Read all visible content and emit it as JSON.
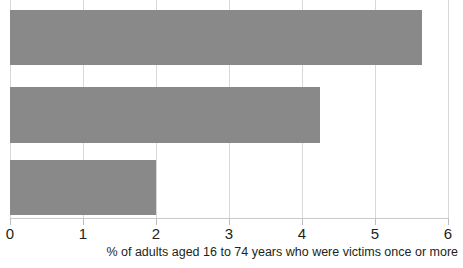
{
  "chart_data": {
    "type": "bar",
    "orientation": "horizontal",
    "title": "",
    "subtitle": "",
    "xlabel": "% of adults aged 16 to 74 years who were victims once or more",
    "ylabel": "",
    "xlim": [
      0,
      6
    ],
    "xticks": [
      0,
      1,
      2,
      3,
      4,
      5,
      6
    ],
    "xtick_labels": [
      "0",
      "1",
      "2",
      "3",
      "4",
      "5",
      "6"
    ],
    "grid": true,
    "grid_axis": "x",
    "legend": false,
    "legend_position": "none",
    "categories": [
      "",
      "",
      ""
    ],
    "values": [
      5.65,
      4.25,
      2.0
    ],
    "bar_color": "#898989",
    "gridline_color": "#d8d8d8",
    "axis_color": "#c9c9c9",
    "text_color": "#231f20",
    "bars": [
      {
        "index": 0,
        "label": "",
        "value": 5.65,
        "top": 10,
        "height": 55
      },
      {
        "index": 1,
        "label": "",
        "value": 4.25,
        "top": 87,
        "height": 56
      },
      {
        "index": 2,
        "label": "",
        "value": 2.0,
        "top": 160,
        "height": 55
      }
    ]
  },
  "axis": {
    "title": "% of adults aged 16 to 74 years who were victims once or more",
    "clipped_category_glyph": "y"
  }
}
